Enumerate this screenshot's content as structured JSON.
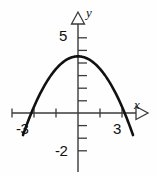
{
  "figure": {
    "name": "downward-parabola-graph",
    "background_color": "#fefefe",
    "curve_color": "#111111",
    "axis_color": "#3a3a3a"
  },
  "axes": {
    "x_label": "x",
    "y_label": "y",
    "x_axis_pixel_y": 113,
    "y_axis_pixel_x": 78,
    "x_unit_pixels": 22,
    "y_unit_pixels": 12.6
  },
  "tick_labels": {
    "y_five": "5",
    "y_neg_two": "-2",
    "x_neg_three": "-3",
    "x_three": "3"
  },
  "chart_data": {
    "type": "line",
    "title": "",
    "xlabel": "x",
    "ylabel": "y",
    "xlim": [
      -3.6,
      3.6
    ],
    "ylim": [
      -2.8,
      6.5
    ],
    "grid": false,
    "legend": null,
    "xticks": [
      -3,
      -2,
      -1,
      0,
      1,
      2,
      3
    ],
    "xtick_labels": [
      "-3",
      "",
      "",
      "",
      "",
      "",
      "3"
    ],
    "yticks": [
      -2,
      -1,
      1,
      2,
      3,
      4,
      5
    ],
    "ytick_labels": [
      "-2",
      "",
      "",
      "",
      "",
      "",
      "5"
    ],
    "series": [
      {
        "name": "parabola",
        "equation": "y = -x^2 + 4.5",
        "vertex": [
          0,
          4.5
        ],
        "x_intercepts": [
          -2.12,
          2.12
        ],
        "y_intercept": 4.5,
        "opens": "down",
        "x": [
          -2.5,
          -2.25,
          -2.0,
          -1.75,
          -1.5,
          -1.25,
          -1.0,
          -0.75,
          -0.5,
          -0.25,
          0,
          0.25,
          0.5,
          0.75,
          1.0,
          1.25,
          1.5,
          1.75,
          2.0,
          2.25,
          2.5
        ],
        "y": [
          -1.75,
          -0.56,
          0.5,
          1.44,
          2.25,
          2.94,
          3.5,
          3.94,
          4.25,
          4.44,
          4.5,
          4.44,
          4.25,
          3.94,
          3.5,
          2.94,
          2.25,
          1.44,
          0.5,
          -0.56,
          -1.75
        ]
      }
    ]
  }
}
